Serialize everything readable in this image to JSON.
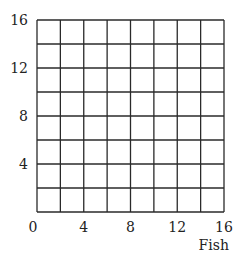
{
  "chart_data": {
    "type": "line",
    "title": "",
    "xlabel": "Fish",
    "ylabel": "",
    "xlim": [
      0,
      16
    ],
    "ylim": [
      0,
      16
    ],
    "x_ticks": [
      0,
      4,
      8,
      12,
      16
    ],
    "y_ticks": [
      4,
      8,
      12,
      16
    ],
    "grid": true,
    "grid_step": 2,
    "series": [],
    "legend": null
  },
  "layout": {
    "plot_left": 37,
    "plot_top": 20,
    "plot_right": 224,
    "plot_bottom": 212
  }
}
